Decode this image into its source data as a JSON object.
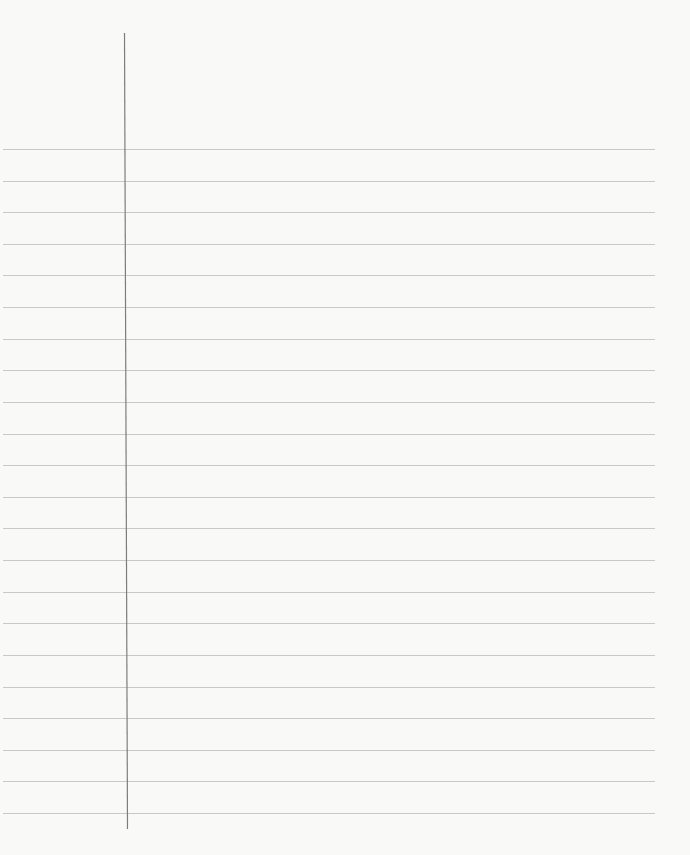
{
  "paper": {
    "type": "lined-paper",
    "background": "#f9f9f8",
    "rule_color": "#c9c9c9",
    "margin_color": "#7d7d7d",
    "rule_count": 22,
    "first_rule_y": 149,
    "rule_spacing": 31.62,
    "rule_x_start": 3,
    "rule_x_end": 655,
    "margin_line": {
      "x_top": 124,
      "x_bottom": 127,
      "y_top": 33,
      "y_bottom": 829
    }
  }
}
